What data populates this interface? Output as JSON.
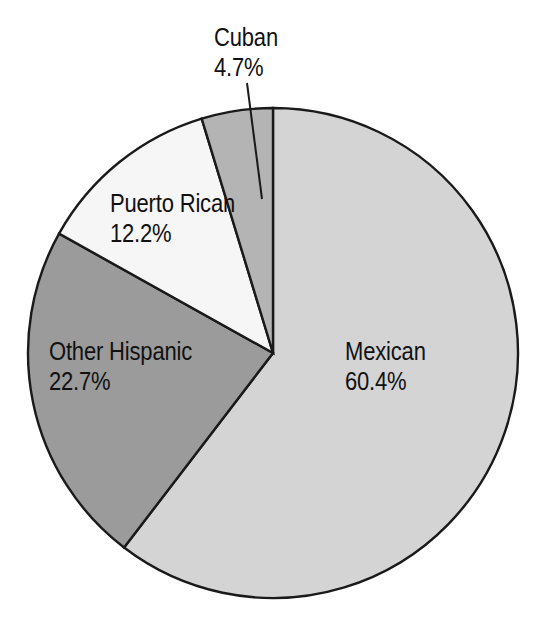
{
  "chart_data": {
    "type": "pie",
    "title": "",
    "subtitle": "",
    "xlabel": "",
    "ylabel": "",
    "legend_position": "none",
    "grid": false,
    "units": "percent",
    "start_angle_deg": 0,
    "direction": "clockwise",
    "categories": [
      "Mexican",
      "Other Hispanic",
      "Puerto Rican",
      "Cuban"
    ],
    "values": [
      60.4,
      22.7,
      12.2,
      4.7
    ],
    "value_labels": [
      "60.4%",
      "22.7%",
      "12.2%",
      "4.7%"
    ],
    "colors": [
      "#d4d4d4",
      "#9b9b9b",
      "#f6f6f6",
      "#b4b4b4"
    ],
    "slices": [
      {
        "name": "Mexican",
        "value": 60.4,
        "value_label": "60.4%",
        "color": "#d4d4d4",
        "label_placement": "inside",
        "start_deg": 0,
        "end_deg": 217.44
      },
      {
        "name": "Other Hispanic",
        "value": 22.7,
        "value_label": "22.7%",
        "color": "#9b9b9b",
        "label_placement": "inside",
        "start_deg": 217.44,
        "end_deg": 299.16
      },
      {
        "name": "Puerto Rican",
        "value": 12.2,
        "value_label": "12.2%",
        "color": "#f6f6f6",
        "label_placement": "inside",
        "start_deg": 299.16,
        "end_deg": 343.08
      },
      {
        "name": "Cuban",
        "value": 4.7,
        "value_label": "4.7%",
        "color": "#b4b4b4",
        "label_placement": "outside-leader",
        "start_deg": 343.08,
        "end_deg": 360
      }
    ]
  },
  "labels": {
    "mexican": {
      "name": "Mexican",
      "value": "60.4%"
    },
    "other_hispanic": {
      "name": "Other Hispanic",
      "value": "22.7%"
    },
    "puerto_rican": {
      "name": "Puerto Rican",
      "value": "12.2%"
    },
    "cuban": {
      "name": "Cuban",
      "value": "4.7%"
    }
  },
  "style": {
    "background": "#ffffff",
    "outline_color": "#1a1a1a",
    "text_color": "#111111"
  }
}
